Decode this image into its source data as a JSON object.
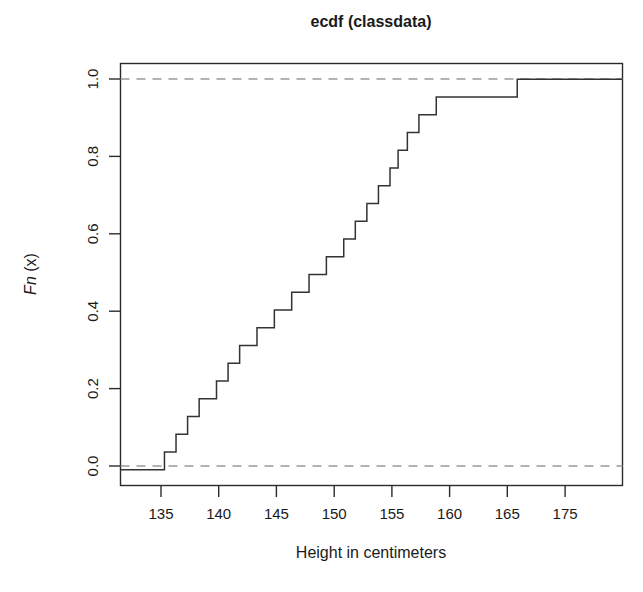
{
  "figure": {
    "title": "ecdf (classdata)",
    "xlabel": "Height in centimeters",
    "ylabel_italic": "Fn",
    "ylabel_rest": " (x)"
  },
  "axes": {
    "x_tick_labels": [
      "135",
      "140",
      "145",
      "150",
      "155",
      "160",
      "165",
      "175"
    ],
    "y_tick_labels": [
      "0.0",
      "0.2",
      "0.4",
      "0.6",
      "0.8",
      "1.0"
    ]
  },
  "chart_data": {
    "type": "line",
    "subtype": "ecdf-step",
    "title": "ecdf (classdata)",
    "xlabel": "Height in centimeters",
    "ylabel": "Fn (x)",
    "xlim": [
      133.2,
      176.6
    ],
    "ylim": [
      -0.04,
      1.04
    ],
    "x_ticks": [
      135,
      140,
      145,
      150,
      155,
      160,
      165,
      170
    ],
    "x_tick_labels": [
      "135",
      "140",
      "145",
      "150",
      "155",
      "160",
      "165",
      "175"
    ],
    "y_ticks": [
      0.0,
      0.2,
      0.4,
      0.6,
      0.8,
      1.0
    ],
    "grid": false,
    "legend": null,
    "n_observations": 22,
    "reference_lines": [
      {
        "y": 0.0,
        "style": "dashed",
        "color": "#9a9a9a"
      },
      {
        "y": 1.0,
        "style": "dashed",
        "color": "#9a9a9a"
      }
    ],
    "x": [
      137.0,
      138.0,
      139.0,
      140.0,
      141.5,
      142.5,
      143.5,
      145.0,
      146.5,
      148.0,
      149.5,
      151.0,
      152.5,
      153.5,
      154.5,
      155.5,
      156.5,
      157.2,
      158.0,
      159.0,
      160.5,
      167.5
    ],
    "y": [
      0.0455,
      0.0909,
      0.1364,
      0.1818,
      0.2273,
      0.2727,
      0.3182,
      0.3636,
      0.4091,
      0.4545,
      0.5,
      0.5455,
      0.5909,
      0.6364,
      0.6818,
      0.7273,
      0.7727,
      0.8182,
      0.8636,
      0.9091,
      0.9545,
      1.0
    ],
    "series": [
      {
        "name": "ecdf(classdata$Height)",
        "step": "post",
        "color": "#333333",
        "points": [
          {
            "x": 137.0,
            "y": 0.0455
          },
          {
            "x": 138.0,
            "y": 0.0909
          },
          {
            "x": 139.0,
            "y": 0.1364
          },
          {
            "x": 140.0,
            "y": 0.1818
          },
          {
            "x": 141.5,
            "y": 0.2273
          },
          {
            "x": 142.5,
            "y": 0.2727
          },
          {
            "x": 143.5,
            "y": 0.3182
          },
          {
            "x": 145.0,
            "y": 0.3636
          },
          {
            "x": 146.5,
            "y": 0.4091
          },
          {
            "x": 148.0,
            "y": 0.4545
          },
          {
            "x": 149.5,
            "y": 0.5
          },
          {
            "x": 151.0,
            "y": 0.5455
          },
          {
            "x": 152.5,
            "y": 0.5909
          },
          {
            "x": 153.5,
            "y": 0.6364
          },
          {
            "x": 154.5,
            "y": 0.6818
          },
          {
            "x": 155.5,
            "y": 0.7273
          },
          {
            "x": 156.5,
            "y": 0.7727
          },
          {
            "x": 157.2,
            "y": 0.8182
          },
          {
            "x": 158.0,
            "y": 0.8636
          },
          {
            "x": 159.0,
            "y": 0.9091
          },
          {
            "x": 160.5,
            "y": 0.9545
          },
          {
            "x": 167.5,
            "y": 1.0
          }
        ]
      }
    ]
  }
}
